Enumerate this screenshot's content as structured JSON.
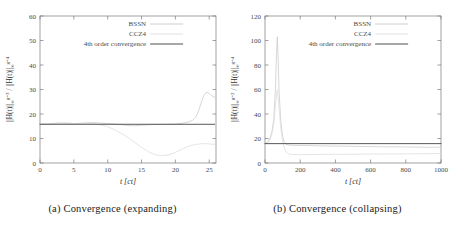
{
  "figure": {
    "panels": [
      {
        "id": "panel-a",
        "caption": "(a) Convergence (expanding)",
        "caption_tag": "(a)",
        "caption_text": "Convergence (expanding)"
      },
      {
        "id": "panel-b",
        "caption": "(b) Convergence (collapsing)",
        "caption_tag": "(b)",
        "caption_text": "Convergence (collapsing)"
      }
    ]
  },
  "legend": {
    "bssn_label": "BSSN",
    "ccz4_label": "CCZ4",
    "fourth_order_label": "4th order convergence"
  },
  "colors": {
    "bssn": "#c9c9c9",
    "ccz4": "#dcdcdc",
    "fourth_order": "#3a3a3a",
    "axis": "#7a7a7a",
    "text": "#1a1a1a"
  },
  "chart_data": [
    {
      "type": "line",
      "id": "convergence-expanding",
      "title": "(a) Convergence (expanding)",
      "xlabel": "t [ct]",
      "ylabel": "||H(t)||∞^{g=3} / ||H(t)||∞^{g=4}",
      "ylabel_parts": {
        "numerator_norm": "||H(t)||",
        "numerator_sub": "∞",
        "numerator_sup": "g=3",
        "denominator_norm": "||H(t)||",
        "denominator_sub": "∞",
        "denominator_sup": "g=4"
      },
      "xlim": [
        0,
        26
      ],
      "ylim": [
        0,
        60
      ],
      "xticks": [
        0,
        5,
        10,
        15,
        20,
        25
      ],
      "yticks": [
        0,
        10,
        20,
        30,
        40,
        50,
        60
      ],
      "grid": false,
      "legend_position": "top-center",
      "reference_value": 15.8,
      "series": [
        {
          "name": "BSSN",
          "color": "#c9c9c9",
          "x": [
            0,
            1,
            2,
            3,
            4,
            5,
            6,
            7,
            8,
            9,
            10,
            11,
            12,
            13,
            14,
            15,
            16,
            17,
            18,
            19,
            20,
            21,
            22,
            22.5,
            23,
            23.4,
            23.8,
            24.2,
            24.6,
            25,
            25.4,
            25.8
          ],
          "values": [
            15.9,
            16.0,
            16.1,
            16.3,
            16.2,
            16.1,
            16.2,
            16.4,
            16.5,
            16.3,
            16.1,
            15.9,
            15.6,
            15.3,
            15.2,
            15.4,
            15.6,
            15.7,
            15.8,
            15.8,
            15.9,
            16.2,
            16.8,
            17.4,
            18.6,
            21.0,
            24.5,
            27.5,
            28.9,
            28.4,
            27.4,
            26.8
          ]
        },
        {
          "name": "CCZ4",
          "color": "#dcdcdc",
          "x": [
            0,
            1,
            2,
            3,
            4,
            5,
            6,
            7,
            8,
            9,
            10,
            11,
            12,
            13,
            14,
            15,
            16,
            17,
            18,
            19,
            20,
            21,
            22,
            23,
            24,
            25,
            25.8
          ],
          "values": [
            15.9,
            16.0,
            16.2,
            16.4,
            16.3,
            16.1,
            16.2,
            16.3,
            16.1,
            15.6,
            14.8,
            13.6,
            12.1,
            10.4,
            8.4,
            6.4,
            4.6,
            3.4,
            3.0,
            3.3,
            4.3,
            5.7,
            6.9,
            7.6,
            7.9,
            7.8,
            7.6
          ]
        },
        {
          "name": "4th order convergence",
          "color": "#3a3a3a",
          "x": [
            0,
            25.8
          ],
          "values": [
            15.8,
            15.8
          ]
        }
      ]
    },
    {
      "type": "line",
      "id": "convergence-collapsing",
      "title": "(b) Convergence (collapsing)",
      "xlabel": "t [ct]",
      "ylabel": "||H(t)||∞^{g=2} / ||H(t)||∞^{g=4}",
      "ylabel_parts": {
        "numerator_norm": "||H(t)||",
        "numerator_sub": "∞",
        "numerator_sup": "g=2",
        "denominator_norm": "||H(t)||",
        "denominator_sub": "∞",
        "denominator_sup": "g=4"
      },
      "xlim": [
        0,
        1000
      ],
      "ylim": [
        0,
        120
      ],
      "xticks": [
        0,
        200,
        400,
        600,
        800,
        1000
      ],
      "yticks": [
        0,
        20,
        40,
        60,
        80,
        100,
        120
      ],
      "grid": false,
      "legend_position": "top-center",
      "reference_value": 15.8,
      "series": [
        {
          "name": "BSSN",
          "color": "#c9c9c9",
          "x": [
            0,
            10,
            20,
            30,
            40,
            50,
            60,
            65,
            70,
            75,
            80,
            90,
            100,
            110,
            120,
            140,
            160,
            200,
            250,
            300,
            350,
            400,
            450,
            500,
            550,
            600,
            650,
            700,
            750,
            800,
            850,
            900,
            940,
            970,
            1000
          ],
          "values": [
            15.8,
            16.5,
            18.0,
            21.0,
            26.0,
            36.0,
            62.0,
            88.0,
            103.0,
            84.0,
            58.0,
            34.0,
            22.0,
            17.0,
            15.2,
            14.6,
            14.4,
            14.3,
            14.2,
            14.0,
            13.9,
            13.8,
            13.7,
            13.6,
            13.5,
            13.4,
            13.3,
            13.2,
            13.2,
            13.1,
            13.0,
            12.9,
            12.8,
            12.9,
            13.0
          ]
        },
        {
          "name": "CCZ4",
          "color": "#dcdcdc",
          "x": [
            0,
            10,
            20,
            30,
            40,
            50,
            60,
            70,
            80,
            90,
            100,
            110,
            120,
            130,
            140,
            160,
            180,
            200,
            250,
            300,
            350,
            400,
            450,
            500,
            550,
            600,
            650,
            700,
            750,
            800,
            850,
            900,
            950,
            1000
          ],
          "values": [
            15.8,
            16.2,
            17.0,
            19.5,
            24.0,
            32.0,
            48.0,
            60.0,
            44.0,
            28.0,
            18.0,
            12.0,
            9.0,
            7.8,
            7.2,
            6.9,
            6.8,
            6.8,
            6.9,
            7.0,
            7.0,
            7.1,
            7.1,
            7.2,
            7.2,
            7.3,
            7.3,
            7.4,
            7.4,
            7.5,
            7.5,
            7.6,
            7.7,
            7.8
          ]
        },
        {
          "name": "4th order convergence",
          "color": "#3a3a3a",
          "x": [
            0,
            1000
          ],
          "values": [
            15.8,
            15.8
          ]
        }
      ]
    }
  ]
}
